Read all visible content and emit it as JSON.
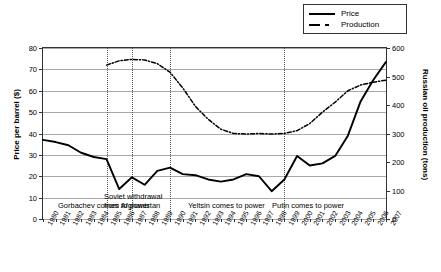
{
  "chart_data": {
    "type": "line",
    "title": "",
    "xlabel": "",
    "ylabel": "Price per barrel ($)",
    "y2label": "Russian oil production (tons)",
    "grid": true,
    "legend_position": "top-right",
    "xlim": [
      1980,
      2007
    ],
    "ylim": [
      0,
      80
    ],
    "y2lim": [
      0,
      600
    ],
    "yticks": [
      0,
      10,
      20,
      30,
      40,
      50,
      60,
      70,
      80
    ],
    "y2ticks": [
      0,
      100,
      200,
      300,
      400,
      500,
      600
    ],
    "x": [
      1980,
      1981,
      1982,
      1983,
      1984,
      1985,
      1986,
      1987,
      1988,
      1989,
      1990,
      1991,
      1992,
      1993,
      1994,
      1995,
      1996,
      1997,
      1998,
      1999,
      2000,
      2001,
      2002,
      2003,
      2004,
      2005,
      2006,
      2007
    ],
    "categories": [
      "1980",
      "1981",
      "1982",
      "1983",
      "1984",
      "1985",
      "1986",
      "1987",
      "1988",
      "1989",
      "1990",
      "1991",
      "1992",
      "1993",
      "1994",
      "1995",
      "1996",
      "1997",
      "1998",
      "1999",
      "2000",
      "2001",
      "2002",
      "2003",
      "2004",
      "2005",
      "2006",
      "2007"
    ],
    "series": [
      {
        "name": "Price",
        "axis": "left",
        "style": "solid",
        "values": [
          37,
          36,
          34.5,
          31,
          29,
          28,
          14,
          19.5,
          16,
          22.5,
          24,
          21,
          20.5,
          18.5,
          17.5,
          18.5,
          21,
          20,
          13,
          18.5,
          29.5,
          25,
          26,
          29.5,
          39,
          55,
          65,
          73.5
        ]
      },
      {
        "name": "Production",
        "axis": "right",
        "style": "dash-dot",
        "values": [
          null,
          null,
          null,
          null,
          null,
          540,
          555,
          560,
          558,
          545,
          515,
          460,
          395,
          350,
          315,
          300,
          298,
          300,
          298,
          300,
          310,
          335,
          375,
          410,
          450,
          470,
          480,
          487
        ]
      }
    ],
    "legend": [
      "Price",
      "Production"
    ],
    "event_lines": [
      {
        "year": 1985,
        "label": "Gorbachev comes to power"
      },
      {
        "year": 1987,
        "label": ""
      },
      {
        "year": 1990,
        "label": "Soviet withdrawal from Afghanistan"
      },
      {
        "year": 1999,
        "label": ""
      }
    ],
    "annotations": [
      {
        "label": "Gorbachev comes to power"
      },
      {
        "label": "Soviet withdrawal"
      },
      {
        "label": "from Afghanistan"
      },
      {
        "label": "Yeltsin comes to power"
      },
      {
        "label": "Putin comes to power"
      }
    ],
    "colors": {
      "price": "#000000",
      "production": "#000000",
      "grid": "#a9a9a9",
      "axis": "#333333"
    }
  }
}
